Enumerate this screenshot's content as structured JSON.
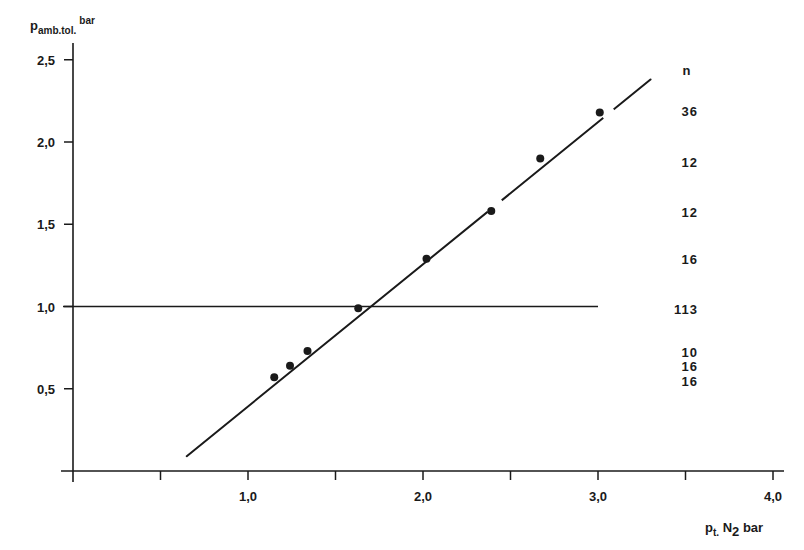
{
  "chart_data": {
    "type": "scatter",
    "title": "",
    "xlabel": "p t. N2 bar",
    "ylabel": "p amb.tol. bar",
    "xlabel_parts": {
      "main": "p",
      "sub": "t.",
      "rest": " N",
      "sub2": "2",
      "unit": " bar"
    },
    "ylabel_parts": {
      "main": "p",
      "sub": "amb.tol.",
      "unit": "bar"
    },
    "xlim": [
      0,
      4.0
    ],
    "ylim": [
      0,
      2.5
    ],
    "x_ticks": [
      0.5,
      1.0,
      1.5,
      2.0,
      2.5,
      3.0,
      3.5,
      4.0
    ],
    "x_tick_labels": [
      "",
      "1,0",
      "",
      "2,0",
      "",
      "3,0",
      "",
      "4,0"
    ],
    "y_ticks": [
      0.5,
      1.0,
      1.5,
      2.0,
      2.5
    ],
    "y_tick_labels": [
      "0,5",
      "1,0",
      "1,5",
      "2,0",
      "2,5"
    ],
    "grid": false,
    "series": [
      {
        "name": "measured points",
        "x": [
          1.15,
          1.24,
          1.34,
          1.63,
          2.02,
          2.39,
          2.67,
          3.01
        ],
        "y": [
          0.57,
          0.64,
          0.73,
          0.99,
          1.29,
          1.58,
          1.9,
          2.18
        ]
      }
    ],
    "fit_line": {
      "x": [
        0.65,
        3.3
      ],
      "y": [
        0.09,
        2.38
      ]
    },
    "reference_line": {
      "y": 1.0,
      "x": [
        0,
        3.0
      ]
    },
    "annotations": {
      "n_header": "n",
      "n_values": [
        {
          "text": "36",
          "y": 2.18
        },
        {
          "text": "12",
          "y": 1.89
        },
        {
          "text": "12",
          "y": 1.58
        },
        {
          "text": "16",
          "y": 1.29
        },
        {
          "text": "113",
          "y": 0.98
        },
        {
          "text": "10",
          "y": 0.69
        },
        {
          "text": "16",
          "y": 0.61
        },
        {
          "text": "16",
          "y": 0.52
        }
      ]
    }
  },
  "colors": {
    "ink": "#1a1a1a",
    "background": "#ffffff"
  }
}
